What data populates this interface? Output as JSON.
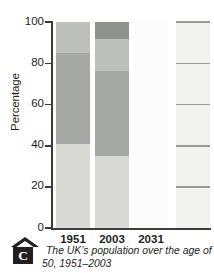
{
  "figure": {
    "marker_letter": "C",
    "caption": "The UK’s population over the age of 50, 1951–2003"
  },
  "axes": {
    "y_title": "Percentage",
    "y_ticks": [
      "100",
      "80",
      "60",
      "40",
      "20",
      "0"
    ],
    "x_labels": [
      "1951",
      "2003",
      "2031"
    ]
  },
  "chart_data": {
    "type": "bar",
    "title": "The UK’s population over the age of 50, 1951–2003",
    "xlabel": "",
    "ylabel": "Percentage",
    "ylim": [
      0,
      100
    ],
    "yticks": [
      0,
      20,
      40,
      60,
      80,
      100
    ],
    "grid": false,
    "legend": "none",
    "stacked": true,
    "categories": [
      "1951",
      "2003",
      "2031"
    ],
    "series": [
      {
        "name": "under 50",
        "values": [
          41,
          35,
          0
        ],
        "color": "#d9dad6"
      },
      {
        "name": "50–64",
        "values": [
          44,
          41,
          0
        ],
        "color": "#a6a8a5"
      },
      {
        "name": "65–74",
        "values": [
          15,
          16,
          0
        ],
        "color": "#bdbfbc"
      },
      {
        "name": "75 and over",
        "values": [
          0,
          8,
          0
        ],
        "color": "#8e918e"
      }
    ],
    "bars": [
      {
        "category": "1951",
        "segments": [
          {
            "from": 0,
            "to": 41,
            "height": 41,
            "color": "#d9dad6"
          },
          {
            "from": 41,
            "to": 85,
            "height": 44,
            "color": "#a6a8a5"
          },
          {
            "from": 85,
            "to": 100,
            "height": 15,
            "color": "#bdbfbc"
          }
        ]
      },
      {
        "category": "2003",
        "segments": [
          {
            "from": 0,
            "to": 35,
            "height": 35,
            "color": "#d9dad6"
          },
          {
            "from": 35,
            "to": 76,
            "height": 41,
            "color": "#a6a8a5"
          },
          {
            "from": 76,
            "to": 92,
            "height": 16,
            "color": "#bdbfbc"
          },
          {
            "from": 92,
            "to": 100,
            "height": 8,
            "color": "#8e918e"
          }
        ]
      },
      {
        "category": "2031",
        "segments": [
          {
            "from": 0,
            "to": 100,
            "height": 100,
            "color": "#fcfcfc"
          }
        ]
      }
    ],
    "extra_bar": {
      "note": "faded right-hand bar with horizontal rules at 20/40/60/80/100",
      "color": "#f2f3f1",
      "rule_color": "#9a9a9a",
      "rules": [
        20,
        40,
        60,
        80,
        100
      ]
    }
  }
}
